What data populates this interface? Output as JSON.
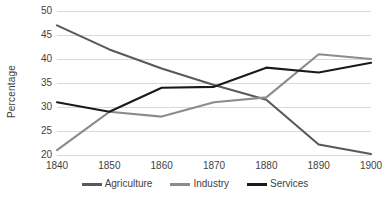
{
  "chart_data": {
    "type": "line",
    "title": "",
    "xlabel": "",
    "ylabel": "Percentage",
    "categories": [
      "1840",
      "1850",
      "1860",
      "1870",
      "1880",
      "1890",
      "1900"
    ],
    "x": [
      1840,
      1850,
      1860,
      1870,
      1880,
      1890,
      1900
    ],
    "ylim": [
      20,
      50
    ],
    "yticks": [
      20,
      25,
      30,
      35,
      40,
      45,
      50
    ],
    "ytick_labels": [
      "20",
      "25",
      "30",
      "35",
      "40",
      "45",
      "50"
    ],
    "grid": true,
    "legend_position": "bottom",
    "series": [
      {
        "name": "Agriculture",
        "color": "#595959",
        "values": [
          47.0,
          42.0,
          38.0,
          34.6,
          31.5,
          22.2,
          20.2
        ]
      },
      {
        "name": "Industry",
        "color": "#8c8c8c",
        "values": [
          21.0,
          29.0,
          28.0,
          31.0,
          32.0,
          41.0,
          40.0
        ]
      },
      {
        "name": "Services",
        "color": "#1a1a1a",
        "values": [
          31.0,
          29.0,
          34.0,
          34.2,
          38.2,
          37.2,
          39.2
        ]
      }
    ]
  },
  "style": {
    "grid_color": "#d9d9d9",
    "text_color": "#3f3f3f",
    "background": "#ffffff"
  }
}
